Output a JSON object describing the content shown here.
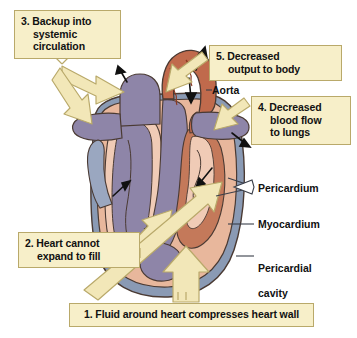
{
  "figure": {
    "background_color": "#ffffff"
  },
  "palette": {
    "callout_fill": "#f7efc9",
    "callout_border": "#b9a96a",
    "arrow_fill": "#f2e7b8",
    "arrow_border": "#b9a96a",
    "myocardium": "#e8b79c",
    "myocardium_dark": "#c4795a",
    "aorta": "#c4715046",
    "aorta_fill": "#c06a4c",
    "vein_purple": "#8e85a8",
    "pericardial_cavity": "#8a9ab4",
    "endocardium_light": "#f0cbb6",
    "outline": "#4a3a33",
    "black_arrow": "#111111",
    "text": "#111111"
  },
  "callouts": [
    {
      "id": "callout-3",
      "number": "3.",
      "lines": [
        "Backup into",
        "systemic",
        "circulation"
      ],
      "text": "3. Backup into systemic circulation"
    },
    {
      "id": "callout-5",
      "number": "5.",
      "lines": [
        "Decreased",
        "output to body"
      ],
      "text": "5. Decreased output to body"
    },
    {
      "id": "callout-4",
      "number": "4.",
      "lines": [
        "Decreased",
        "blood flow",
        "to lungs"
      ],
      "text": "4. Decreased blood flow to lungs"
    },
    {
      "id": "callout-2",
      "number": "2.",
      "lines": [
        "Heart cannot",
        "expand to fill"
      ],
      "text": "2. Heart cannot expand to fill"
    },
    {
      "id": "callout-1",
      "number": "1.",
      "lines": [
        "Fluid around heart compresses heart wall"
      ],
      "text": "1. Fluid around heart compresses heart wall"
    }
  ],
  "anatomy_labels": [
    {
      "id": "label-aorta",
      "text": "Aorta",
      "pointer": "none"
    },
    {
      "id": "label-pericardium",
      "text": "Pericardium",
      "pointer": "arrowhead"
    },
    {
      "id": "label-myocardium",
      "text": "Myocardium",
      "pointer": "line"
    },
    {
      "id": "label-pericardial-cavity",
      "text": "Pericardial\ncavity",
      "pointer": "line"
    }
  ],
  "callout_text": {
    "c3_l1": "3. Backup into",
    "c3_l2": "systemic",
    "c3_l3": "circulation",
    "c5_l1": "5. Decreased",
    "c5_l2": "output to body",
    "c4_l1": "4. Decreased",
    "c4_l2": "blood flow",
    "c4_l3": "to lungs",
    "c2_l1": "2. Heart cannot",
    "c2_l2": "expand to fill",
    "c1_l1": "1. Fluid around heart compresses heart wall"
  },
  "label_text": {
    "aorta": "Aorta",
    "pericardium": "Pericardium",
    "myocardium": "Myocardium",
    "pericardial_cavity_l1": "Pericardial",
    "pericardial_cavity_l2": "cavity"
  }
}
